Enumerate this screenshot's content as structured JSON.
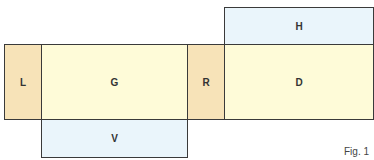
{
  "diagram": {
    "regions": [
      {
        "id": "L",
        "label": "L",
        "color": "#f7e3b8"
      },
      {
        "id": "G",
        "label": "G",
        "color": "#fefbd8"
      },
      {
        "id": "R",
        "label": "R",
        "color": "#f7e3b8"
      },
      {
        "id": "D",
        "label": "D",
        "color": "#fefbd8"
      },
      {
        "id": "H",
        "label": "H",
        "color": "#eaf5fb"
      },
      {
        "id": "V",
        "label": "V",
        "color": "#eaf5fb"
      }
    ],
    "caption": "Fig. 1"
  }
}
